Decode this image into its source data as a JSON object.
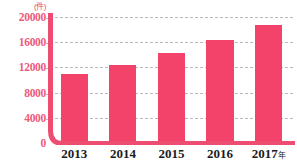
{
  "chart_data": {
    "type": "bar",
    "title": "",
    "subtitle": "",
    "xlabel": "",
    "ylabel": "",
    "unit_label": "(件)",
    "categories": [
      "2013",
      "2014",
      "2015",
      "2016",
      "2017"
    ],
    "category_suffixes": [
      "",
      "",
      "",
      "",
      "年"
    ],
    "values": [
      11000,
      12400,
      14300,
      16300,
      18700
    ],
    "ylim": [
      0,
      20000
    ],
    "yticks": [
      0,
      4000,
      8000,
      12000,
      16000,
      20000
    ],
    "ytick_labels": [
      "0",
      "4000",
      "8000",
      "12000",
      "16000",
      "20000"
    ],
    "grid": true,
    "legend": false,
    "legend_position": "none",
    "series": [
      {
        "name": "件数",
        "values": [
          11000,
          12400,
          14300,
          16300,
          18700
        ]
      }
    ],
    "colors": {
      "bar": "#f4436a",
      "axis": "#ee4d72",
      "ytick_text": "#ef5b7c",
      "xtick_text": "#1b1b1b",
      "gridline": "#b9b9b9",
      "background": "#ffffff"
    }
  }
}
